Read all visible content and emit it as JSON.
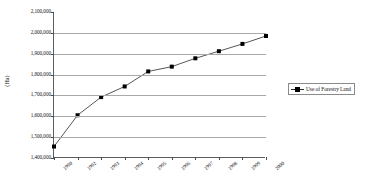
{
  "chart_data": {
    "type": "line",
    "title": "",
    "xlabel": "",
    "ylabel": "(Ha)",
    "x": [
      "1990",
      "1992",
      "1993",
      "1994",
      "1995",
      "1996",
      "1997",
      "1998",
      "1999",
      "2000"
    ],
    "categories": [
      "1990",
      "1992",
      "1993",
      "1994",
      "1995",
      "1996",
      "1997",
      "1998",
      "1999",
      "2000"
    ],
    "series": [
      {
        "name": "Use of Forestry Land",
        "values": [
          1455000,
          1605000,
          1692000,
          1743000,
          1815000,
          1838000,
          1878000,
          1912000,
          1947000,
          1985000
        ],
        "color": "#000000",
        "marker": "square"
      }
    ],
    "ylim": [
      1400000,
      2100000
    ],
    "ytick_values": [
      2100000,
      2000000,
      1900000,
      1800000,
      1700000,
      1600000,
      1500000,
      1400000
    ],
    "ytick_labels": [
      "2,100,000",
      "2,000,000",
      "1,900,000",
      "1,800,000",
      "1,700,000",
      "1,600,000",
      "1,500,000",
      "1,400,000"
    ],
    "grid": true,
    "grid_axis": "y",
    "legend_position": "right",
    "legend_entries": [
      "Use of Forestry Land"
    ]
  },
  "legend": {
    "entry_label": "Use of Forestry Land"
  },
  "axes": {
    "y_title": "(Ha)"
  }
}
